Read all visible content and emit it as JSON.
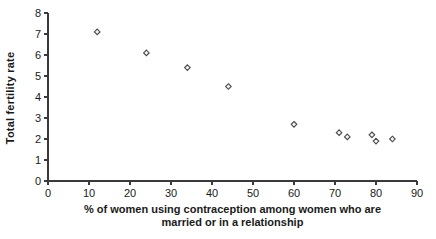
{
  "chart_data": {
    "type": "scatter",
    "title": "",
    "xlabel": "% of women using contraception among women who are married or in a relationship",
    "xlabel_lines": [
      "% of women using contraception among women who are",
      "married or in a relationship"
    ],
    "ylabel": "Total fertility rate",
    "x": [
      12,
      24,
      34,
      44,
      60,
      71,
      73,
      79,
      80,
      84
    ],
    "y": [
      7.1,
      6.1,
      5.4,
      4.5,
      2.7,
      2.3,
      2.1,
      2.2,
      1.9,
      2.0
    ],
    "xlim": [
      0,
      90
    ],
    "ylim": [
      0,
      8
    ],
    "xticks": [
      0,
      10,
      20,
      30,
      40,
      50,
      60,
      70,
      80,
      90
    ],
    "yticks": [
      0,
      1,
      2,
      3,
      4,
      5,
      6,
      7,
      8
    ],
    "grid": false,
    "legend": "none",
    "marker": "open-diamond",
    "colors": {
      "marker_stroke": "#4a4a4a",
      "marker_fill": "#f4f4f4",
      "axis": "#3a3a3a",
      "tick_text": "#1a1a1a"
    }
  }
}
